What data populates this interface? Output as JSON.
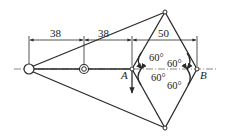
{
  "diagram": {
    "type": "mechanism / truss linkage",
    "dimensions": [
      {
        "id": "dim1",
        "value": "38",
        "from": "left-pivot",
        "to": "bearing"
      },
      {
        "id": "dim2",
        "value": "38",
        "from": "bearing",
        "to": "point-A"
      },
      {
        "id": "dim3",
        "value": "50",
        "from": "point-A",
        "to": "point-B"
      }
    ],
    "points": {
      "A": "A",
      "B": "B"
    },
    "angles": [
      {
        "id": "ang-a-upper",
        "label": "60°"
      },
      {
        "id": "ang-a-lower",
        "label": "60°"
      },
      {
        "id": "ang-b-upper",
        "label": "60°"
      },
      {
        "id": "ang-b-lower",
        "label": "60°"
      }
    ],
    "colors": {
      "line": "#2a2a2a",
      "background": "#ffffff"
    }
  }
}
